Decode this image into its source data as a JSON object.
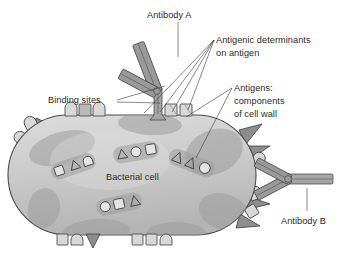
{
  "figure": {
    "background_color": "#ffffff",
    "width": 349,
    "height": 257
  },
  "labels": {
    "antibody_a": "Antibody A",
    "antibody_b": "Antibody B",
    "binding_sites": "Binding sites",
    "bacterial_cell": "Bacterial cell",
    "antigenic_determinants_line1": "Antigenic determinants",
    "antigenic_determinants_line2": "on antigen",
    "antigens_line1": "Antigens:",
    "antigens_line2": "components",
    "antigens_line3": "of cell wall"
  },
  "colors": {
    "outline": "#4a4a4a",
    "cell_fill_light": "#d6d6d6",
    "cell_fill_mid": "#c2c2c2",
    "patch": "#9d9d9d",
    "spike_dark": "#8d8d8d",
    "antigen_light": "#d8d8d8",
    "antibody": "#9a9a9a",
    "text": "#2b2b2b",
    "leader_line": "#3a3a3a"
  },
  "cell": {
    "name": "bacterial-cell",
    "shape": "capsule",
    "center_x": 132,
    "center_y": 175,
    "width": 248,
    "height": 120
  },
  "surface_antigens": {
    "top": [
      {
        "type": "rounded-cap",
        "x": 70,
        "y": 118
      },
      {
        "type": "square",
        "x": 83,
        "y": 118
      },
      {
        "type": "rounded-cap",
        "x": 96,
        "y": 118
      },
      {
        "type": "square",
        "x": 168,
        "y": 118
      },
      {
        "type": "square",
        "x": 181,
        "y": 118
      }
    ],
    "bottom": [
      {
        "type": "square",
        "x": 62,
        "y": 233
      },
      {
        "type": "rounded-cap",
        "x": 75,
        "y": 233
      },
      {
        "type": "triangle-down",
        "x": 90,
        "y": 233
      },
      {
        "type": "square",
        "x": 137,
        "y": 233
      },
      {
        "type": "square",
        "x": 150,
        "y": 233
      },
      {
        "type": "rounded-cap",
        "x": 163,
        "y": 233
      }
    ],
    "left": [
      {
        "type": "rounded-cap",
        "x": 32,
        "y": 128
      },
      {
        "type": "triangle",
        "x": 43,
        "y": 122
      },
      {
        "type": "rounded-cap",
        "x": 24,
        "y": 140
      }
    ],
    "right": [
      {
        "type": "triangle",
        "x": 248,
        "y": 136
      },
      {
        "type": "triangle",
        "x": 256,
        "y": 148
      },
      {
        "type": "rounded-cap",
        "x": 258,
        "y": 162
      },
      {
        "type": "rounded-cap",
        "x": 257,
        "y": 198
      },
      {
        "type": "square",
        "x": 250,
        "y": 212
      },
      {
        "type": "triangle",
        "x": 243,
        "y": 225
      }
    ]
  },
  "internal_clusters": [
    {
      "name": "cluster-left",
      "shapes": [
        "square",
        "triangle",
        "circle"
      ],
      "x": 72,
      "y": 166,
      "rotation": -18
    },
    {
      "name": "cluster-top",
      "shapes": [
        "triangle",
        "circle",
        "square"
      ],
      "x": 135,
      "y": 152,
      "rotation": -10
    },
    {
      "name": "cluster-right",
      "shapes": [
        "triangle",
        "triangle",
        "circle"
      ],
      "x": 190,
      "y": 162,
      "rotation": 22
    },
    {
      "name": "cluster-bottom",
      "shapes": [
        "circle",
        "square",
        "triangle"
      ],
      "x": 118,
      "y": 204,
      "rotation": -12
    }
  ],
  "antibodies": [
    {
      "name": "antibody-a",
      "label": "Antibody A",
      "orientation": "vertical",
      "binds_at_x": 158,
      "binds_at_y": 120
    },
    {
      "name": "antibody-b",
      "label": "Antibody B",
      "orientation": "horizontal",
      "binds_at_x": 260,
      "binds_at_y": 180
    }
  ]
}
